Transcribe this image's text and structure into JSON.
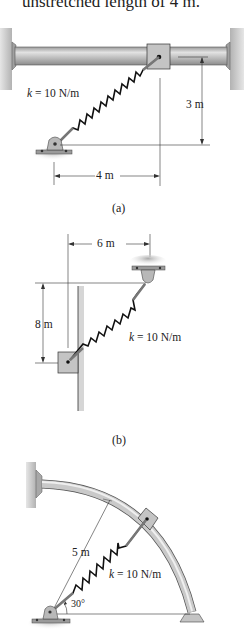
{
  "header_text": "unstretched length of 4 m.",
  "figures": [
    {
      "id": "a",
      "caption": "(a)",
      "spring_label_k": "k",
      "spring_label_value": " = 10 N/m",
      "dim_vertical": "3 m",
      "dim_horizontal": "4 m"
    },
    {
      "id": "b",
      "caption": "(b)",
      "spring_label_k": "k",
      "spring_label_value": " = 10 N/m",
      "dim_vertical": "8 m",
      "dim_horizontal": "6 m"
    },
    {
      "id": "c",
      "caption": "",
      "spring_label_k": "k",
      "spring_label_value": " = 10 N/m",
      "dim_radius": "5 m",
      "angle": "30°"
    }
  ],
  "colors": {
    "rod": "#b9b9b9",
    "rod_dark": "#8a8a8a",
    "wall": "#c8c8c8",
    "spring": "#1a1a1a",
    "dim_line": "#333333"
  }
}
